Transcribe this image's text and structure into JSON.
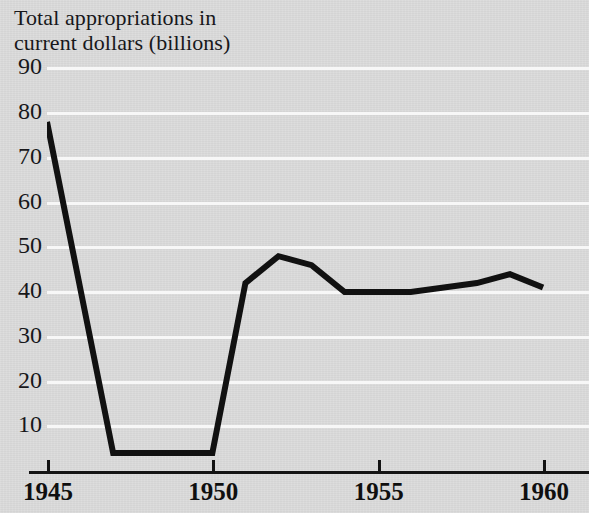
{
  "chart_data": {
    "type": "line",
    "title": "Total appropriations in\ncurrent dollars (billions)",
    "xlabel": "",
    "ylabel": "Total appropriations in current dollars (billions)",
    "xlim": [
      1945,
      1961
    ],
    "ylim": [
      0,
      95
    ],
    "grid": true,
    "legend": null,
    "y_ticks": [
      90,
      80,
      70,
      60,
      50,
      40,
      30,
      20,
      10
    ],
    "x_ticks": [
      1945,
      1950,
      1955,
      1960
    ],
    "x_tick_labels": [
      "1945",
      "1950",
      "1955",
      "1960"
    ],
    "x": [
      1945,
      1946,
      1947,
      1948,
      1949,
      1950,
      1951,
      1952,
      1953,
      1954,
      1955,
      1956,
      1957,
      1958,
      1959,
      1960
    ],
    "series": [
      {
        "name": "Total appropriations",
        "values": [
          78,
          41,
          4,
          4,
          4,
          4,
          42,
          48,
          46,
          40,
          40,
          40,
          41,
          42,
          44,
          41
        ]
      }
    ],
    "line_color": "#111111",
    "line_width": 6,
    "background_color": "#dbdbdb",
    "gridline_color": "#f7f7f7",
    "axis_color": "#141414"
  },
  "axis": {
    "y_labels": [
      "90",
      "80",
      "70",
      "60",
      "50",
      "40",
      "30",
      "20",
      "10"
    ],
    "x_labels": [
      "1945",
      "1950",
      "1955",
      "1960"
    ]
  }
}
